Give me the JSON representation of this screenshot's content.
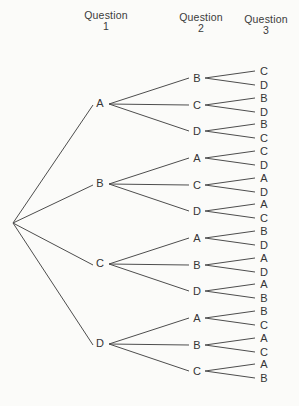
{
  "headers": [
    {
      "line1": "Question",
      "line2": "1"
    },
    {
      "line1": "Question",
      "line2": "2"
    },
    {
      "line1": "Question",
      "line2": "3"
    }
  ],
  "tree": {
    "branches": [
      {
        "label": "A",
        "children": [
          {
            "label": "B",
            "children": [
              {
                "label": "C"
              },
              {
                "label": "D"
              }
            ]
          },
          {
            "label": "C",
            "children": [
              {
                "label": "B"
              },
              {
                "label": "D"
              }
            ]
          },
          {
            "label": "D",
            "children": [
              {
                "label": "B"
              },
              {
                "label": "C"
              }
            ]
          }
        ]
      },
      {
        "label": "B",
        "children": [
          {
            "label": "A",
            "children": [
              {
                "label": "C"
              },
              {
                "label": "D"
              }
            ]
          },
          {
            "label": "C",
            "children": [
              {
                "label": "A"
              },
              {
                "label": "D"
              }
            ]
          },
          {
            "label": "D",
            "children": [
              {
                "label": "A"
              },
              {
                "label": "C"
              }
            ]
          }
        ]
      },
      {
        "label": "C",
        "children": [
          {
            "label": "A",
            "children": [
              {
                "label": "B"
              },
              {
                "label": "D"
              }
            ]
          },
          {
            "label": "B",
            "children": [
              {
                "label": "A"
              },
              {
                "label": "D"
              }
            ]
          },
          {
            "label": "D",
            "children": [
              {
                "label": "A"
              },
              {
                "label": "B"
              }
            ]
          }
        ]
      },
      {
        "label": "D",
        "children": [
          {
            "label": "A",
            "children": [
              {
                "label": "B"
              },
              {
                "label": "C"
              }
            ]
          },
          {
            "label": "B",
            "children": [
              {
                "label": "A"
              },
              {
                "label": "C"
              }
            ]
          },
          {
            "label": "C",
            "children": [
              {
                "label": "A"
              },
              {
                "label": "B"
              }
            ]
          }
        ]
      }
    ]
  },
  "colors": {
    "background": "#fbfbf9",
    "line": "#4d4d4d",
    "text": "#353535"
  }
}
